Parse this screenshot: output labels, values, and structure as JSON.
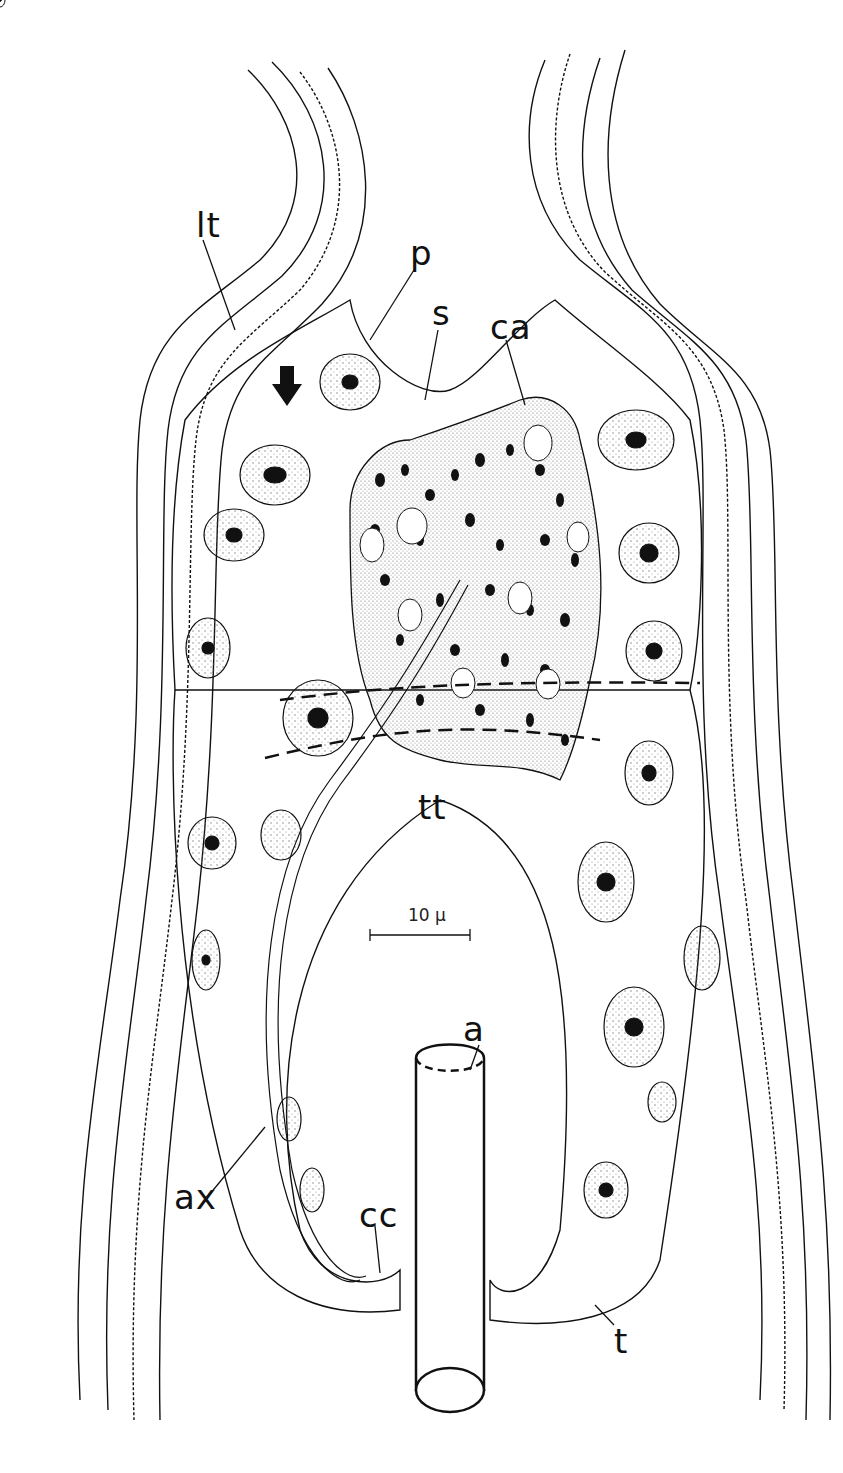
{
  "figure": {
    "type": "histological line drawing",
    "scale_bar": {
      "label": "10 µ",
      "length_px": 90
    },
    "labels": [
      {
        "id": "lt",
        "text": "lt",
        "x": 196,
        "y": 218
      },
      {
        "id": "p",
        "text": "p",
        "x": 410,
        "y": 248
      },
      {
        "id": "s",
        "text": "s",
        "x": 432,
        "y": 305
      },
      {
        "id": "ca",
        "text": "ca",
        "x": 499,
        "y": 318
      },
      {
        "id": "tt",
        "text": "tt",
        "x": 420,
        "y": 800
      },
      {
        "id": "a",
        "text": "a",
        "x": 463,
        "y": 1022
      },
      {
        "id": "ax",
        "text": "ax",
        "x": 174,
        "y": 1183
      },
      {
        "id": "cc",
        "text": "cc",
        "x": 359,
        "y": 1211
      },
      {
        "id": "t",
        "text": "t",
        "x": 614,
        "y": 1336
      }
    ],
    "arrow": {
      "direction": "down",
      "x": 287,
      "y": 378
    },
    "colors": {
      "ink": "#111111",
      "stipple": "#9a9a9a",
      "paper": "#ffffff"
    }
  }
}
